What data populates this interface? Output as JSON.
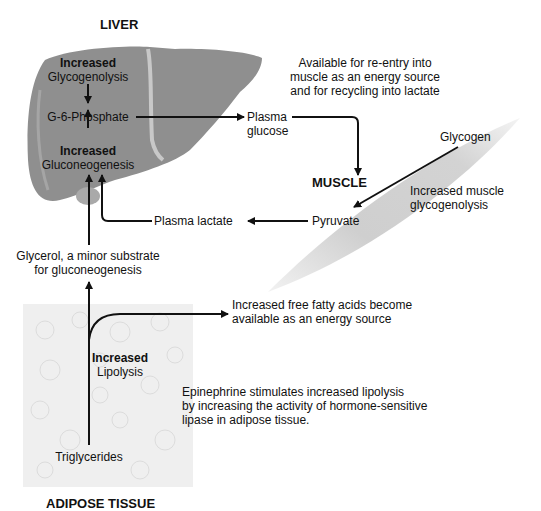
{
  "regions": {
    "liver": "LIVER",
    "muscle": "MUSCLE",
    "adipose": "ADIPOSE TISSUE"
  },
  "liver": {
    "glycogenolysis_bold": "Increased",
    "glycogenolysis": "Glycogenolysis",
    "g6p": "G-6-Phosphate",
    "gluconeogenesis_bold": "Increased",
    "gluconeogenesis": "Gluconeogenesis"
  },
  "plasma_glucose": {
    "line1": "Plasma",
    "line2": "glucose"
  },
  "available_note": {
    "line1": "Available for re-entry into",
    "line2": "muscle as an energy source",
    "line3": "and for recycling into lactate"
  },
  "muscle": {
    "glycogen": "Glycogen",
    "glycogenolysis_line1": "Increased muscle",
    "glycogenolysis_line2": "glycogenolysis",
    "pyruvate": "Pyruvate"
  },
  "plasma_lactate": "Plasma lactate",
  "glycerol": {
    "line1": "Glycerol, a minor substrate",
    "line2": "for gluconeogenesis"
  },
  "ffa": {
    "line1": "Increased free fatty acids become",
    "line2": "available as an energy source"
  },
  "lipolysis": {
    "bold": "Increased",
    "label": "Lipolysis"
  },
  "epinephrine": {
    "line1": "Epinephrine stimulates increased lipolysis",
    "line2": "by increasing the activity of hormone-sensitive",
    "line3": "lipase in adipose tissue."
  },
  "triglycerides": "Triglycerides",
  "colors": {
    "liver_fill": "#8f8f8f",
    "liver_highlight": "#bdbdbd",
    "muscle_fill": "#d0d0d0",
    "adipose_fill": "#f0f0f0",
    "arrow": "#111111"
  }
}
